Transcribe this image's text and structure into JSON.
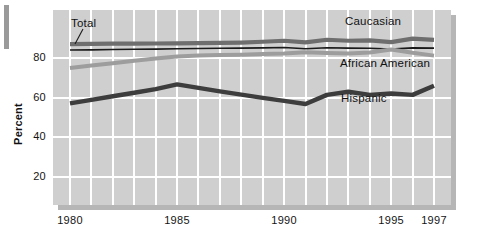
{
  "figure": {
    "name": "line-chart-high-school-completion"
  },
  "axes": {
    "ylabel": "Percent",
    "yticks": [
      "20",
      "40",
      "60",
      "80"
    ],
    "ytick_values": [
      20,
      40,
      60,
      80
    ],
    "xticks": [
      "1980",
      "1985",
      "1990",
      "1995",
      "1997"
    ],
    "xtick_values": [
      1980,
      1985,
      1990,
      1995,
      1997
    ]
  },
  "annotations": {
    "total": "Total",
    "caucasian": "Caucasian",
    "african_american": "African American",
    "hispanic": "Hispanic"
  },
  "colors": {
    "plot_background": "#cfcfcf",
    "gridline": "#ffffff",
    "panel_shadow": "#b6b6b6",
    "total_line": "#1a1a1a",
    "caucasian_line": "#6e6e6e",
    "african_american_line": "#9d9d9d",
    "hispanic_line": "#3d3d3d",
    "text": "#141414"
  },
  "chart_data": {
    "type": "line",
    "title": "",
    "xlabel": "",
    "ylabel": "Percent",
    "xlim": [
      1980,
      1997
    ],
    "ylim": [
      0,
      100
    ],
    "grid": true,
    "legend": "inline-annotations",
    "x": [
      1980,
      1981,
      1982,
      1983,
      1984,
      1985,
      1986,
      1987,
      1988,
      1989,
      1990,
      1991,
      1992,
      1993,
      1994,
      1995,
      1996,
      1997
    ],
    "series": [
      {
        "name": "Caucasian",
        "color": "#6e6e6e",
        "values": [
          87.0,
          87.1,
          87.2,
          87.2,
          87.3,
          87.4,
          87.5,
          87.6,
          87.8,
          88.2,
          88.7,
          87.9,
          89.2,
          88.7,
          88.9,
          88.0,
          89.8,
          89.1
        ]
      },
      {
        "name": "Total",
        "color": "#1a1a1a",
        "values": [
          84.0,
          84.1,
          84.3,
          84.4,
          84.5,
          84.7,
          84.8,
          84.9,
          85.0,
          85.1,
          85.3,
          84.7,
          85.2,
          85.0,
          84.9,
          84.5,
          85.1,
          85.0
        ]
      },
      {
        "name": "African American",
        "color": "#9d9d9d",
        "values": [
          75.0,
          76.2,
          77.4,
          78.6,
          79.7,
          80.8,
          81.2,
          81.5,
          81.7,
          82.0,
          82.3,
          82.9,
          82.5,
          82.3,
          82.8,
          84.3,
          82.6,
          81.2
        ]
      },
      {
        "name": "Hispanic",
        "color": "#3d3d3d",
        "values": [
          57.1,
          58.9,
          60.7,
          62.5,
          64.3,
          66.7,
          64.9,
          63.2,
          61.5,
          59.9,
          58.4,
          56.8,
          61.4,
          63.0,
          61.4,
          62.1,
          61.4,
          66.0
        ]
      }
    ]
  }
}
